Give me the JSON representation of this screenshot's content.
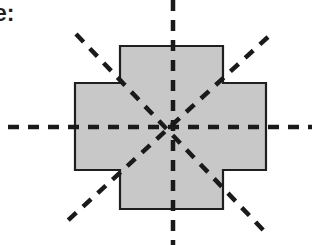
{
  "caption": {
    "text": "e:"
  },
  "diagram": {
    "shape": {
      "name": "plus-shaped cross",
      "fill": "#c8c8c8",
      "stroke": "#1f1f1f",
      "points": "120,46 223,46 223,83 266,83 266,170 223,170 223,209 120,209 120,170 75,170 75,83 120,83"
    },
    "center": {
      "x": 173,
      "y": 127
    },
    "line_color": "#1a1a1a",
    "symmetry_lines": [
      {
        "name": "horizontal",
        "x1": 8,
        "y1": 127,
        "x2": 312,
        "y2": 127
      },
      {
        "name": "vertical",
        "x1": 173,
        "y1": 0,
        "x2": 173,
        "y2": 245
      },
      {
        "name": "diagonal-down",
        "x1": 76,
        "y1": 34,
        "x2": 266,
        "y2": 233
      },
      {
        "name": "diagonal-up",
        "x1": 268,
        "y1": 37,
        "x2": 64,
        "y2": 224
      }
    ],
    "line_count": 4
  }
}
